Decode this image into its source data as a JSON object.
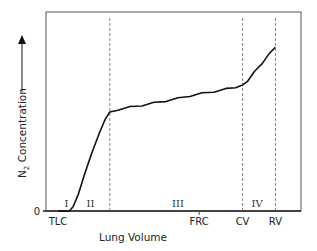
{
  "chart_data": {
    "type": "line",
    "title": "",
    "xlabel": "Lung Volume",
    "ylabel": "N2 Concentration",
    "ylabel_main": "N",
    "ylabel_sub": "2",
    "ylabel_rest": " Concentration",
    "y_axis_arrow": true,
    "y_tick_labels": [
      {
        "value": 0,
        "label": "0"
      }
    ],
    "xlim": [
      0,
      100
    ],
    "ylim": [
      0,
      100
    ],
    "x_markers": [
      {
        "name": "TLC",
        "x": 0,
        "style": "none",
        "label": "TLC"
      },
      {
        "name": "phase-boundary-2-3",
        "x": 21.6,
        "style": "dashed",
        "label": ""
      },
      {
        "name": "FRC",
        "x": 58.8,
        "style": "tick",
        "label": "FRC"
      },
      {
        "name": "CV",
        "x": 76.9,
        "style": "dashed",
        "label": "CV"
      },
      {
        "name": "RV",
        "x": 90.6,
        "style": "dashed",
        "label": "RV"
      }
    ],
    "phases": [
      {
        "label": "I",
        "x": 3.5
      },
      {
        "label": "II",
        "x": 13.5
      },
      {
        "label": "III",
        "x": 50
      },
      {
        "label": "IV",
        "x": 83
      }
    ],
    "series": [
      {
        "name": "N2 washout",
        "x": [
          0,
          4.7,
          6.3,
          8.6,
          11,
          14.1,
          17.3,
          19.6,
          21.6,
          25,
          30,
          35,
          40,
          45,
          50,
          55,
          60,
          65,
          70,
          74,
          76.9,
          79,
          82,
          85,
          88,
          90.6
        ],
        "y": [
          0,
          0,
          3,
          12,
          25,
          40,
          54,
          63,
          68.3,
          70,
          71.5,
          73,
          74.5,
          76,
          77.5,
          79.5,
          81,
          82.5,
          84,
          85.5,
          86.4,
          90,
          96,
          102,
          108,
          113
        ]
      }
    ],
    "grid": false,
    "legend": "none"
  }
}
